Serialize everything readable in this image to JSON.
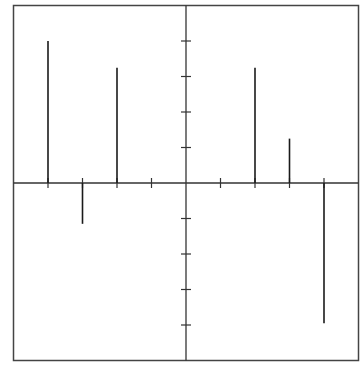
{
  "chart_data": {
    "type": "bar",
    "subtype": "stem",
    "title": "",
    "xlabel": "",
    "ylabel": "",
    "xlim": [
      -5,
      5
    ],
    "ylim": [
      -5,
      5
    ],
    "grid": false,
    "legend": null,
    "x_ticks": [
      -4,
      -3,
      -2,
      -1,
      0,
      1,
      2,
      3,
      4
    ],
    "y_ticks": [
      -4,
      -3,
      -2,
      -1,
      0,
      1,
      2,
      3,
      4
    ],
    "x": [
      -4,
      -3,
      -2,
      2,
      3,
      4
    ],
    "values": [
      4.0,
      -1.15,
      3.25,
      3.25,
      1.25,
      -3.95
    ],
    "colors": {
      "line": "#1a1a1a",
      "frame": "#444444",
      "background": "#ffffff"
    }
  }
}
